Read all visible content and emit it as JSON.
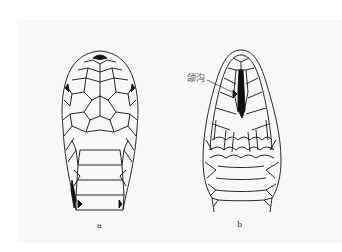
{
  "figure": {
    "panels": [
      {
        "id": "a",
        "label": "a",
        "view": "dorsal head view"
      },
      {
        "id": "b",
        "label": "b",
        "view": "ventral head view"
      }
    ],
    "annotations": [
      {
        "panel": "b",
        "text": "颌沟"
      }
    ],
    "colors": {
      "background": "#ffffff",
      "panel": "#f8f8f8",
      "ink": "#111111",
      "label": "#555555"
    }
  }
}
